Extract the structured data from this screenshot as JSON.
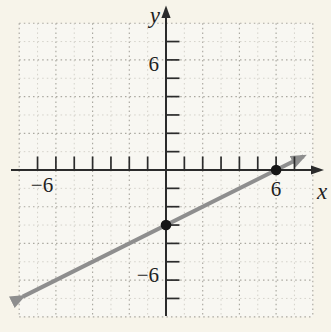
{
  "figure": {
    "background_color": "#f7f4ea",
    "grid_panel_color": "#f8f7f2"
  },
  "chart_data": {
    "type": "line",
    "title": "",
    "xlabel": "x",
    "ylabel": "y",
    "xlim": [
      -8,
      8
    ],
    "ylim": [
      -8,
      8
    ],
    "grid": true,
    "grid_minor_step": 1,
    "grid_major_step": 2,
    "tick_step": 1,
    "tick_range": [
      -7,
      7
    ],
    "axis_tick_labels": [
      {
        "axis": "x",
        "value": -6,
        "label": "−6"
      },
      {
        "axis": "x",
        "value": 6,
        "label": "6"
      },
      {
        "axis": "y",
        "value": 6,
        "label": "6"
      },
      {
        "axis": "y",
        "value": -6,
        "label": "−6"
      }
    ],
    "points": [
      [
        0,
        -3
      ],
      [
        6,
        0
      ]
    ],
    "series": [
      {
        "name": "graph-line",
        "slope": 0.5,
        "intercept": -3,
        "equation": "y = (1/2)x - 3",
        "x_start": -7.8,
        "x_end": 7.5,
        "arrow_start": true,
        "arrow_end": true
      }
    ],
    "colors": {
      "axis": "#2b2b2b",
      "tick": "#2b2b2b",
      "grid_major": "#aaa8a0",
      "grid_minor": "#d0cec6",
      "line": "#8e8e8e",
      "point": "#161616",
      "text": "#1f1f1f"
    }
  }
}
